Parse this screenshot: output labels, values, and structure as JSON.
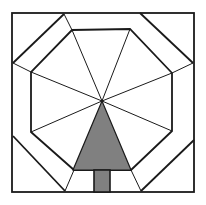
{
  "drawing": {
    "description": "Quilt block line drawing: square with octagon border and radiating lines, gray tree in bottom center",
    "colors": {
      "line": "#1a1a1a",
      "background": "#ffffff",
      "tree_fill": "#808080"
    },
    "outer_square": [
      12,
      13,
      194,
      192
    ],
    "outer_octagon": [
      [
        64,
        14
      ],
      [
        140,
        13
      ],
      [
        193,
        63
      ],
      [
        194,
        140
      ],
      [
        141,
        191
      ],
      [
        65,
        191
      ],
      [
        13,
        136
      ],
      [
        13,
        63
      ]
    ],
    "inner_octagon": [
      [
        72,
        30
      ],
      [
        130,
        29
      ],
      [
        172,
        73
      ],
      [
        172,
        131
      ],
      [
        131,
        170
      ],
      [
        74,
        170
      ],
      [
        31,
        132
      ],
      [
        31,
        72
      ]
    ],
    "center": [
      102,
      101
    ],
    "tree": {
      "triangle": [
        [
          102,
          101
        ],
        [
          73,
          170
        ],
        [
          131,
          170
        ]
      ],
      "trunk": [
        94,
        170,
        110,
        192
      ]
    }
  }
}
